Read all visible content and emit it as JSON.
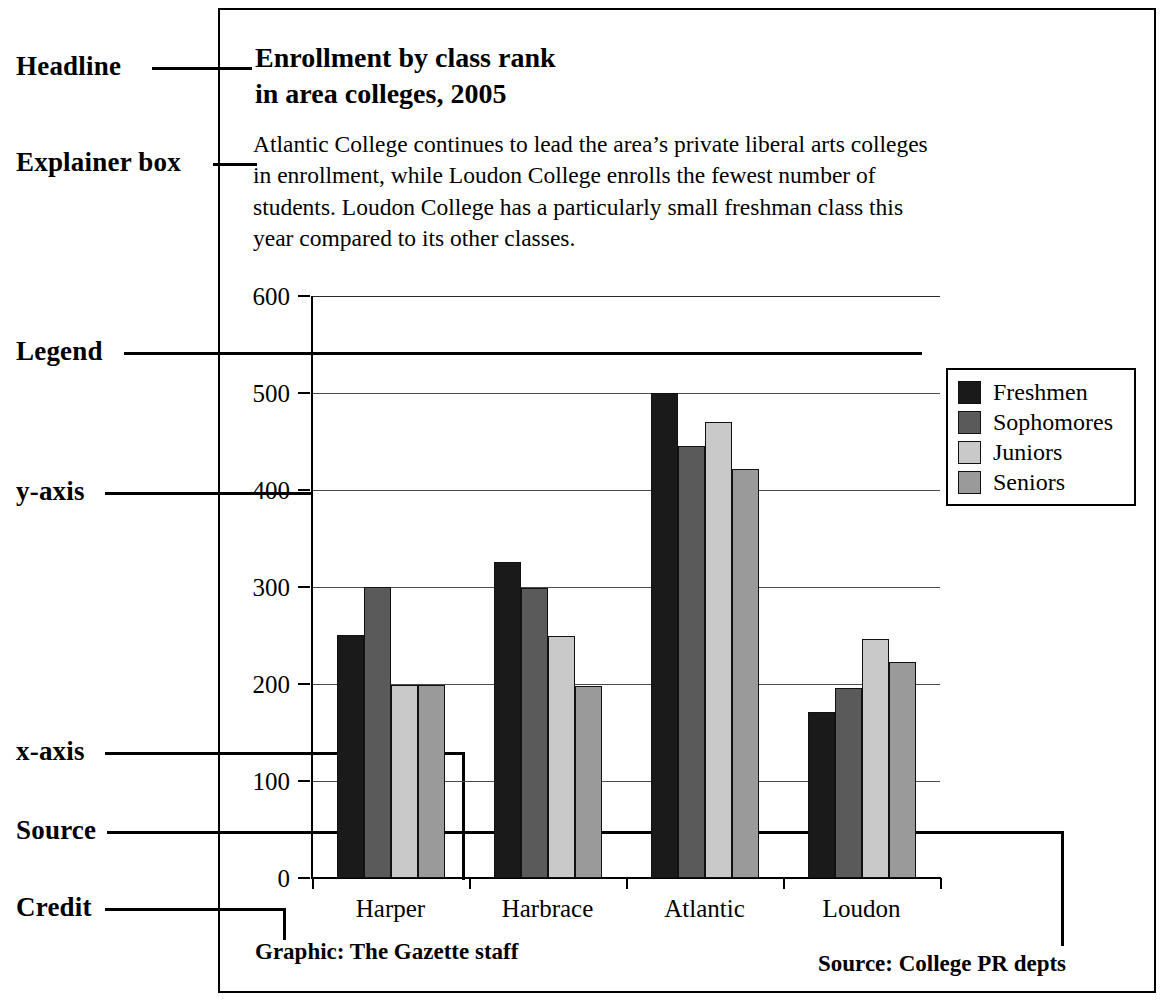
{
  "annotations": [
    {
      "label": "Headline"
    },
    {
      "label": "Explainer box"
    },
    {
      "label": "Legend"
    },
    {
      "label": "y-axis"
    },
    {
      "label": "x-axis"
    },
    {
      "label": "Source"
    },
    {
      "label": "Credit"
    }
  ],
  "graphic": {
    "headline_line1": "Enrollment by class rank",
    "headline_line2": "in area colleges, 2005",
    "explainer": "Atlantic College continues to lead the area’s private liberal arts colleges in enrollment, while Loudon College enrolls the fewest number of students. Loudon College has a particularly small freshman class this year compared to its other classes.",
    "credit": "Graphic: The Gazette staff",
    "source": "Source: College PR depts"
  },
  "chart_data": {
    "type": "bar",
    "title": "Enrollment by class rank in area colleges, 2005",
    "xlabel": "",
    "ylabel": "",
    "categories": [
      "Harper",
      "Harbrace",
      "Atlantic",
      "Loudon"
    ],
    "series": [
      {
        "name": "Freshmen",
        "color": "#1a1a1a",
        "values": [
          251,
          326,
          500,
          171
        ]
      },
      {
        "name": "Sophomores",
        "color": "#5a5a5a",
        "values": [
          300,
          299,
          445,
          196
        ]
      },
      {
        "name": "Juniors",
        "color": "#c9c9c9",
        "values": [
          199,
          249,
          470,
          246
        ]
      },
      {
        "name": "Seniors",
        "color": "#9a9a9a",
        "values": [
          199,
          198,
          422,
          223
        ]
      }
    ],
    "ylim": [
      0,
      600
    ],
    "yticks": [
      0,
      100,
      200,
      300,
      400,
      500,
      600
    ],
    "ytick_labels": [
      "0",
      "100",
      "200",
      "300",
      "400",
      "500",
      "600"
    ],
    "grid": true,
    "legend_position": "upper right"
  }
}
